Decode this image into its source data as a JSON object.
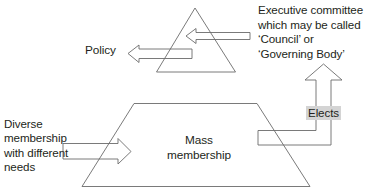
{
  "diagram": {
    "type": "flow-diagram",
    "background_color": "#ffffff",
    "stroke_color": "#6b6b6b",
    "text_color": "#231f20",
    "highlight_color": "#d4d4d4",
    "labels": {
      "executive_committee": "Executive committee\nwhich may be called\n‘Council’ or\n‘Governing Body’",
      "policy": "Policy",
      "diverse_membership": "Diverse\nmembership\nwith different\nneeds",
      "mass_membership": "Mass\nmembership",
      "elects": "Elects"
    },
    "shapes": [
      {
        "name": "executive-committee-triangle",
        "kind": "triangle",
        "points": "195,8 235,72 157,72"
      },
      {
        "name": "mass-membership-trapezoid",
        "kind": "trapezoid",
        "points": "134,103 257,103 310,186 82,186"
      }
    ],
    "arrows": [
      {
        "name": "executive-committee-arrow",
        "direction": "left",
        "from": "executive-committee-label",
        "to": "executive-committee-triangle"
      },
      {
        "name": "policy-arrow",
        "direction": "left",
        "from": "executive-committee-triangle",
        "to": "policy-label"
      },
      {
        "name": "diverse-membership-arrow",
        "direction": "right",
        "from": "diverse-membership-label",
        "to": "mass-membership-trapezoid"
      },
      {
        "name": "elects-arrow",
        "direction": "up",
        "from": "mass-membership-trapezoid",
        "to": "executive-committee-triangle",
        "label": "Elects"
      }
    ]
  }
}
